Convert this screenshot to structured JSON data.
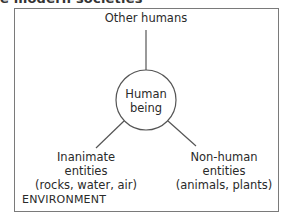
{
  "title_fragment": "e modern societies",
  "diagram": {
    "environment_label": "ENVIRONMENT",
    "center_node": {
      "line1": "Human",
      "line2": "being"
    },
    "nodes": [
      {
        "position": "top",
        "line1": "Other humans"
      },
      {
        "position": "bottom-left",
        "line1": "Inanimate",
        "line2": "entities",
        "line3": "(rocks, water, air)"
      },
      {
        "position": "bottom-right",
        "line1": "Non-human",
        "line2": "entities",
        "line3": "(animals, plants)"
      }
    ],
    "colors": {
      "frame": "#7a7a7a",
      "lines": "#555555",
      "text": "#2a2a2a"
    }
  }
}
